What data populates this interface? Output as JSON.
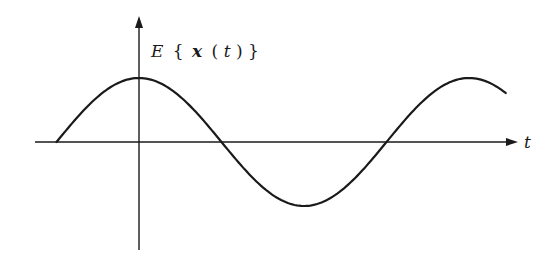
{
  "figure": {
    "y_label": {
      "E": "E",
      "open": "{",
      "x": "x",
      "paren_open": "(",
      "t": "t",
      "paren_close": ")",
      "close": "}"
    },
    "x_label": "t",
    "stroke_color": "#1a1a1a",
    "background": "#ffffff"
  },
  "chart_data": {
    "type": "line",
    "title": "",
    "xlabel": "t",
    "ylabel": "E{x(t)}",
    "series": [
      {
        "name": "E{x(t)}",
        "function": "cos",
        "start_phase_deg": -90,
        "end_phase_deg": 400
      }
    ],
    "grid": false,
    "legend": "none"
  }
}
